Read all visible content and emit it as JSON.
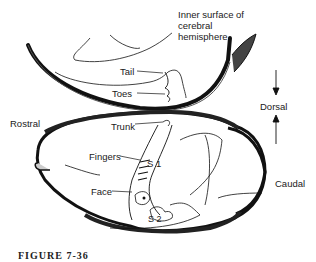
{
  "figure": {
    "caption": "FIGURE 7-36",
    "labels": {
      "inner_surface": [
        "Inner surface of",
        "cerebral",
        "hemisphere"
      ],
      "tail": "Tail",
      "toes": "Toes",
      "trunk": "Trunk",
      "fingers": "Fingers",
      "face": "Face",
      "s1": "S 1",
      "s2": "S 2",
      "rostral": "Rostral",
      "caudal": "Caudal",
      "dorsal": "Dorsal"
    },
    "colors": {
      "ink": "#1a1a1a",
      "background": "#ffffff"
    }
  }
}
